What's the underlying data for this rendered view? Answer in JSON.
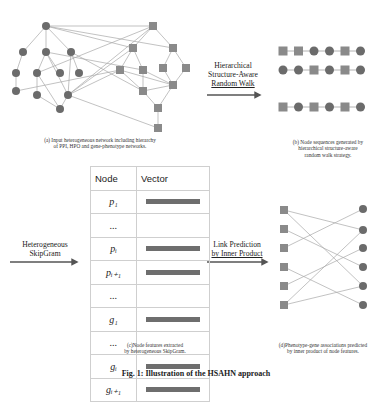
{
  "panels": {
    "a": {
      "caption_line1": "(a) Input heterogeneous network including hierarchy",
      "caption_line2": "of PPI, HPO and gene-phenotype networks."
    },
    "b": {
      "arrow_label_line1": "Hierarchical",
      "arrow_label_line2": "Structure-Aware",
      "arrow_label_line3": "Random Walk",
      "sequences": [
        [
          "square",
          "square",
          "circle",
          "circle",
          "square",
          "circle"
        ],
        [
          "circle",
          "circle",
          "square",
          "circle",
          "square",
          "circle"
        ],
        [
          "square",
          "circle",
          "square",
          "circle",
          "square",
          "circle"
        ]
      ],
      "caption_line1": "(b) Node sequences generated by",
      "caption_line2": "hierarchical structure-aware",
      "caption_line3": "random walk strategy."
    },
    "c": {
      "arrow_label_line1": "Heterogeneous",
      "arrow_label_line2": "SkipGram",
      "table": {
        "headers": [
          "Node",
          "Vector"
        ],
        "rows": [
          {
            "node": "p₁",
            "has_vector": true
          },
          {
            "node": "...",
            "has_vector": false
          },
          {
            "node": "pᵢ",
            "has_vector": true
          },
          {
            "node": "pᵢ₊₁",
            "has_vector": true
          },
          {
            "node": "...",
            "has_vector": false
          },
          {
            "node": "g₁",
            "has_vector": true
          },
          {
            "node": "...",
            "has_vector": false
          },
          {
            "node": "gᵢ",
            "has_vector": true
          },
          {
            "node": "gᵢ₊₁",
            "has_vector": true
          }
        ]
      },
      "caption_line1": "(c)Node features extracted",
      "caption_line2": "by heterogeneous SkipGram."
    },
    "d": {
      "arrow_label_line1": "Link Prediction",
      "arrow_label_line2": "by Inner Product",
      "caption_line1": "(d)Phenotype-gene associations predicted",
      "caption_line2": "by inner product of node features."
    }
  },
  "figure_caption": "Fig. 1: Illustration of the HSAHN approach",
  "colors": {
    "node_fill": "#6b6b6b",
    "square_fill": "#8a8a8a",
    "edge": "#a0a0a0",
    "arrow": "#555555"
  }
}
